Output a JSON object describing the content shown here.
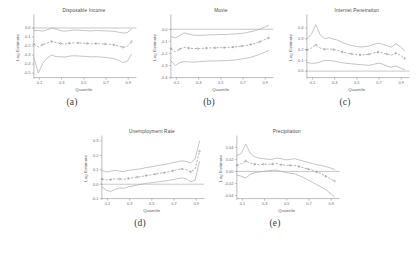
{
  "figure": {
    "name": "quantile-regression-panel-figure",
    "background": "#ffffff",
    "line_color": "#a9a9ae",
    "center_color": "#8e8e94",
    "axis_color": "#8d8d93"
  },
  "chart_data": [
    {
      "id": "a",
      "type": "line",
      "title": "Disposable Income",
      "caption": "(a)",
      "xlabel": "Quantile",
      "ylabel": "Log Estimate",
      "grid": false,
      "legend": "none",
      "xlim": [
        0.05,
        0.95
      ],
      "ylim": [
        -0.55,
        0.12
      ],
      "xticks": [
        0.1,
        0.3,
        0.5,
        0.7,
        0.9
      ],
      "xticklabels": [
        "0.1",
        "0.3",
        "0.5",
        "0.7",
        "0.9"
      ],
      "yticks": [
        -0.5,
        -0.4,
        -0.3,
        -0.2,
        -0.1,
        0.0
      ],
      "yticklabels": [
        "-0.5",
        "-0.4",
        "-0.3",
        "-0.2",
        "-0.1",
        "0.0"
      ],
      "zero_line": 0.0,
      "x": [
        0.05,
        0.09,
        0.13,
        0.17,
        0.21,
        0.25,
        0.29,
        0.33,
        0.37,
        0.41,
        0.45,
        0.49,
        0.53,
        0.57,
        0.61,
        0.65,
        0.69,
        0.73,
        0.77,
        0.81,
        0.85,
        0.89,
        0.93
      ],
      "series": [
        {
          "name": "Upper 95% CI",
          "values": [
            -0.03,
            -0.028,
            -0.035,
            -0.02,
            -0.004,
            -0.01,
            -0.03,
            -0.036,
            -0.028,
            -0.022,
            -0.024,
            -0.028,
            -0.03,
            -0.032,
            -0.028,
            -0.03,
            -0.032,
            -0.034,
            -0.038,
            -0.046,
            -0.056,
            -0.052,
            -0.012
          ]
        },
        {
          "name": "Point Estimate",
          "values": [
            -0.18,
            -0.21,
            -0.184,
            -0.168,
            -0.15,
            -0.162,
            -0.172,
            -0.178,
            -0.17,
            -0.164,
            -0.166,
            -0.17,
            -0.172,
            -0.176,
            -0.172,
            -0.176,
            -0.178,
            -0.182,
            -0.188,
            -0.198,
            -0.214,
            -0.208,
            -0.15
          ]
        },
        {
          "name": "Lower 95% CI",
          "values": [
            -0.33,
            -0.5,
            -0.392,
            -0.332,
            -0.3,
            -0.318,
            -0.318,
            -0.322,
            -0.312,
            -0.308,
            -0.31,
            -0.314,
            -0.316,
            -0.32,
            -0.318,
            -0.322,
            -0.326,
            -0.332,
            -0.34,
            -0.356,
            -0.382,
            -0.372,
            -0.29
          ]
        }
      ]
    },
    {
      "id": "b",
      "type": "line",
      "title": "Movie",
      "caption": "(b)",
      "xlabel": "Quantile",
      "ylabel": "Log Estimate",
      "grid": false,
      "legend": "none",
      "xlim": [
        0.05,
        0.95
      ],
      "ylim": [
        -0.4,
        0.1
      ],
      "xticks": [
        0.1,
        0.3,
        0.5,
        0.7,
        0.9
      ],
      "xticklabels": [
        "0.1",
        "0.3",
        "0.5",
        "0.7",
        "0.9"
      ],
      "yticks": [
        -0.4,
        -0.3,
        -0.2,
        -0.1,
        0.0
      ],
      "yticklabels": [
        "-0.4",
        "-0.3",
        "-0.2",
        "-0.1",
        "0.0"
      ],
      "zero_line": 0.0,
      "x": [
        0.05,
        0.09,
        0.13,
        0.17,
        0.21,
        0.25,
        0.29,
        0.33,
        0.37,
        0.41,
        0.45,
        0.49,
        0.53,
        0.57,
        0.61,
        0.65,
        0.69,
        0.73,
        0.77,
        0.81,
        0.85,
        0.89,
        0.93
      ],
      "series": [
        {
          "name": "Upper 95% CI",
          "values": [
            -0.06,
            -0.072,
            -0.052,
            -0.03,
            -0.04,
            -0.048,
            -0.05,
            -0.05,
            -0.048,
            -0.046,
            -0.046,
            -0.044,
            -0.044,
            -0.042,
            -0.04,
            -0.038,
            -0.034,
            -0.028,
            -0.02,
            -0.012,
            0.0,
            0.016,
            0.032
          ]
        },
        {
          "name": "Point Estimate",
          "values": [
            -0.16,
            -0.186,
            -0.164,
            -0.15,
            -0.156,
            -0.16,
            -0.16,
            -0.158,
            -0.156,
            -0.154,
            -0.154,
            -0.152,
            -0.152,
            -0.15,
            -0.148,
            -0.144,
            -0.14,
            -0.134,
            -0.126,
            -0.116,
            -0.104,
            -0.088,
            -0.072
          ]
        },
        {
          "name": "Lower 95% CI",
          "values": [
            -0.262,
            -0.3,
            -0.276,
            -0.268,
            -0.27,
            -0.272,
            -0.27,
            -0.266,
            -0.264,
            -0.262,
            -0.262,
            -0.26,
            -0.26,
            -0.258,
            -0.256,
            -0.25,
            -0.246,
            -0.24,
            -0.232,
            -0.22,
            -0.208,
            -0.192,
            -0.176
          ]
        }
      ]
    },
    {
      "id": "c",
      "type": "line",
      "title": "Internet Penetration",
      "caption": "(c)",
      "xlabel": "Quantile",
      "ylabel": "Log Estimate",
      "grid": false,
      "legend": "none",
      "xlim": [
        0.05,
        0.95
      ],
      "ylim": [
        -0.06,
        0.5
      ],
      "xticks": [
        0.1,
        0.3,
        0.5,
        0.7,
        0.9
      ],
      "xticklabels": [
        "0.1",
        "0.3",
        "0.5",
        "0.7",
        "0.9"
      ],
      "yticks": [
        0.0,
        0.1,
        0.2,
        0.3,
        0.4
      ],
      "yticklabels": [
        "0.0",
        "0.1",
        "0.2",
        "0.3",
        "0.4"
      ],
      "zero_line": 0.0,
      "x": [
        0.05,
        0.09,
        0.13,
        0.17,
        0.21,
        0.25,
        0.29,
        0.33,
        0.37,
        0.41,
        0.45,
        0.49,
        0.53,
        0.57,
        0.61,
        0.65,
        0.69,
        0.73,
        0.77,
        0.81,
        0.85,
        0.89,
        0.93
      ],
      "series": [
        {
          "name": "Upper 95% CI",
          "values": [
            0.3,
            0.34,
            0.43,
            0.336,
            0.3,
            0.31,
            0.296,
            0.286,
            0.264,
            0.25,
            0.238,
            0.23,
            0.224,
            0.226,
            0.232,
            0.248,
            0.258,
            0.25,
            0.236,
            0.222,
            0.252,
            0.23,
            0.186
          ]
        },
        {
          "name": "Point Estimate",
          "values": [
            0.196,
            0.214,
            0.244,
            0.214,
            0.202,
            0.206,
            0.2,
            0.192,
            0.178,
            0.168,
            0.16,
            0.154,
            0.15,
            0.152,
            0.156,
            0.168,
            0.176,
            0.17,
            0.158,
            0.148,
            0.166,
            0.15,
            0.118
          ]
        },
        {
          "name": "Lower 95% CI",
          "values": [
            0.082,
            0.072,
            0.074,
            0.086,
            0.098,
            0.1,
            0.094,
            0.086,
            0.078,
            0.072,
            0.068,
            0.064,
            0.06,
            0.058,
            0.054,
            0.062,
            0.074,
            0.066,
            0.048,
            0.036,
            0.048,
            0.03,
            0.014
          ]
        }
      ]
    },
    {
      "id": "d",
      "type": "line",
      "title": "Unemployment Rate",
      "caption": "(d)",
      "xlabel": "Quantile",
      "ylabel": "Log Estimate",
      "grid": false,
      "legend": "none",
      "xlim": [
        0.05,
        0.95
      ],
      "ylim": [
        -0.1,
        0.32
      ],
      "xticks": [
        0.1,
        0.3,
        0.5,
        0.7,
        0.9
      ],
      "xticklabels": [
        "0.1",
        "0.3",
        "0.5",
        "0.7",
        "0.9"
      ],
      "yticks": [
        -0.1,
        0.0,
        0.1,
        0.2,
        0.3
      ],
      "yticklabels": [
        "-0.1",
        "0.0",
        "0.1",
        "0.2",
        "0.3"
      ],
      "zero_line": 0.0,
      "x": [
        0.05,
        0.09,
        0.13,
        0.17,
        0.21,
        0.25,
        0.29,
        0.33,
        0.37,
        0.41,
        0.45,
        0.49,
        0.53,
        0.57,
        0.61,
        0.65,
        0.69,
        0.73,
        0.77,
        0.81,
        0.85,
        0.89,
        0.93
      ],
      "series": [
        {
          "name": "Upper 95% CI",
          "values": [
            0.094,
            0.086,
            0.09,
            0.096,
            0.09,
            0.088,
            0.096,
            0.1,
            0.104,
            0.108,
            0.116,
            0.12,
            0.126,
            0.132,
            0.136,
            0.142,
            0.15,
            0.156,
            0.162,
            0.158,
            0.148,
            0.176,
            0.3
          ]
        },
        {
          "name": "Point Estimate",
          "values": [
            0.036,
            0.03,
            0.032,
            0.038,
            0.036,
            0.034,
            0.04,
            0.046,
            0.05,
            0.054,
            0.06,
            0.064,
            0.07,
            0.076,
            0.08,
            0.086,
            0.094,
            0.1,
            0.106,
            0.102,
            0.086,
            0.104,
            0.23
          ]
        },
        {
          "name": "Lower 95% CI",
          "values": [
            -0.018,
            -0.042,
            -0.05,
            -0.036,
            -0.026,
            -0.028,
            -0.018,
            -0.012,
            -0.006,
            0.0,
            0.006,
            0.01,
            0.014,
            0.018,
            0.022,
            0.026,
            0.032,
            0.038,
            0.044,
            0.038,
            0.016,
            0.028,
            0.158
          ]
        }
      ]
    },
    {
      "id": "e",
      "type": "line",
      "title": "Precipitation",
      "caption": "(e)",
      "xlabel": "Quantile",
      "ylabel": "Log Estimate",
      "grid": false,
      "legend": "none",
      "xlim": [
        0.05,
        0.95
      ],
      "ylim": [
        -0.045,
        0.055
      ],
      "xticks": [
        0.1,
        0.3,
        0.5,
        0.7,
        0.9
      ],
      "xticklabels": [
        "0.1",
        "0.3",
        "0.5",
        "0.7",
        "0.9"
      ],
      "yticks": [
        -0.04,
        -0.02,
        0.0,
        0.02,
        0.04
      ],
      "yticklabels": [
        "-0.04",
        "-0.02",
        "0.00",
        "0.02",
        "0.04"
      ],
      "zero_line": 0.0,
      "x": [
        0.05,
        0.09,
        0.13,
        0.17,
        0.21,
        0.25,
        0.29,
        0.33,
        0.37,
        0.41,
        0.45,
        0.49,
        0.53,
        0.57,
        0.61,
        0.65,
        0.69,
        0.73,
        0.77,
        0.81,
        0.85,
        0.89,
        0.93
      ],
      "series": [
        {
          "name": "Upper 95% CI",
          "values": [
            0.026,
            0.03,
            0.045,
            0.03,
            0.024,
            0.022,
            0.021,
            0.02,
            0.02,
            0.022,
            0.021,
            0.019,
            0.02,
            0.021,
            0.019,
            0.017,
            0.015,
            0.013,
            0.011,
            0.01,
            0.008,
            0.006,
            0.003
          ]
        },
        {
          "name": "Point Estimate",
          "values": [
            0.01,
            0.013,
            0.017,
            0.014,
            0.012,
            0.011,
            0.012,
            0.012,
            0.012,
            0.013,
            0.011,
            0.01,
            0.01,
            0.01,
            0.008,
            0.006,
            0.004,
            0.002,
            -0.001,
            -0.004,
            -0.008,
            -0.012,
            -0.016
          ]
        },
        {
          "name": "Lower 95% CI",
          "values": [
            -0.006,
            -0.008,
            -0.011,
            -0.005,
            -0.002,
            -0.001,
            0.0,
            0.001,
            0.002,
            0.002,
            0.0,
            -0.002,
            -0.003,
            -0.004,
            -0.007,
            -0.01,
            -0.014,
            -0.018,
            -0.022,
            -0.026,
            -0.03,
            -0.036,
            -0.042
          ]
        }
      ]
    }
  ]
}
